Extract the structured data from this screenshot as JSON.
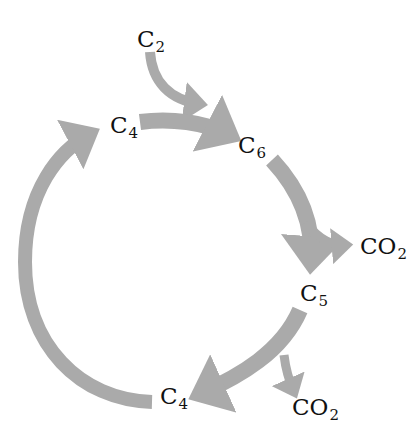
{
  "diagram": {
    "type": "cycle",
    "arrow_color": "#aaaaaa",
    "nodes": [
      {
        "id": "c2_in",
        "base": "C",
        "sub": "2"
      },
      {
        "id": "c4_top",
        "base": "C",
        "sub": "4"
      },
      {
        "id": "c6",
        "base": "C",
        "sub": "6"
      },
      {
        "id": "co2_right",
        "base": "CO",
        "sub": "2"
      },
      {
        "id": "c5",
        "base": "C",
        "sub": "5"
      },
      {
        "id": "c4_bottom",
        "base": "C",
        "sub": "4"
      },
      {
        "id": "co2_bottom",
        "base": "CO",
        "sub": "2"
      }
    ],
    "edges": [
      {
        "from": "C2",
        "to": "C6",
        "kind": "input"
      },
      {
        "from": "C4",
        "to": "C6",
        "kind": "cycle"
      },
      {
        "from": "C6",
        "to": "C5",
        "kind": "cycle"
      },
      {
        "from": "C6",
        "to": "CO2",
        "kind": "release"
      },
      {
        "from": "C5",
        "to": "C4",
        "kind": "cycle"
      },
      {
        "from": "C5",
        "to": "CO2",
        "kind": "release"
      },
      {
        "from": "C4",
        "to": "C4",
        "kind": "cycle"
      }
    ]
  }
}
